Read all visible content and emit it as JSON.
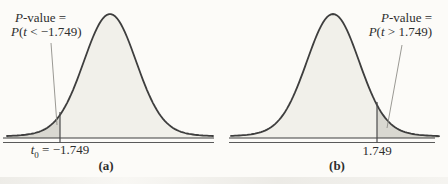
{
  "figure_type": "statistical-figure",
  "colors": {
    "background": "#fcfbf8",
    "curve": "#3e3e3e",
    "body_fill": "#f1f0ea",
    "tail_fill": "#d9d8d1",
    "axis_line": "#5a5a5a",
    "leader_line": "#8f8d88",
    "text": "#2e2e2e"
  },
  "chart_data": [
    {
      "type": "area",
      "curve": "t-distribution density",
      "shaded_region": "left tail",
      "critical_value": -1.749,
      "annotation": {
        "full": "P-value = P(t < −1.749)",
        "l1_italic": "P",
        "l1_rest": "-value =",
        "l2_italic_p": "P",
        "l2_paren": "(",
        "l2_italic_t": "t",
        "l2_rest": " < −1.749)"
      },
      "axis_label": {
        "full": "t0 = −1.749",
        "italic": "t",
        "sub": "0",
        "rest": " = −1.749"
      },
      "caption": "(a)"
    },
    {
      "type": "area",
      "curve": "t-distribution density",
      "shaded_region": "right tail",
      "critical_value": 1.749,
      "annotation": {
        "full": "P-value = P(t > 1.749)",
        "l1_italic": "P",
        "l1_rest": "-value =",
        "l2_italic_p": "P",
        "l2_paren": "(",
        "l2_italic_t": "t",
        "l2_rest": " > 1.749)"
      },
      "axis_label": {
        "full": "1.749"
      },
      "caption": "(b)"
    }
  ]
}
